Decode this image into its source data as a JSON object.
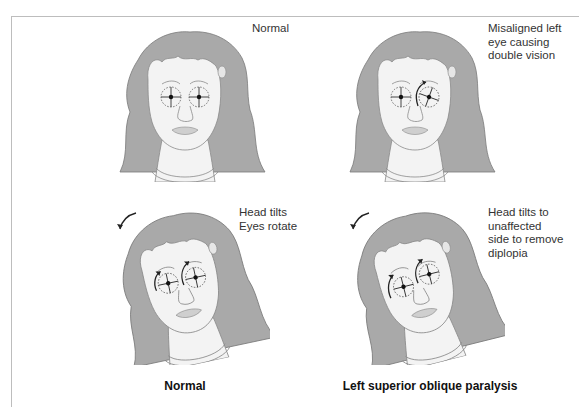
{
  "figure": {
    "panels": [
      {
        "id": "normal-upright",
        "note": "Normal",
        "head_tilted": false,
        "eye_arrows": []
      },
      {
        "id": "palsy-upright",
        "note": "Misaligned left\neye causing\ndouble vision",
        "head_tilted": false,
        "eye_arrows": [
          "left-eye-extorsion"
        ]
      },
      {
        "id": "normal-tilted",
        "note": "Head tilts\nEyes rotate",
        "head_tilted": true,
        "eye_arrows": [
          "right-eye",
          "left-eye"
        ]
      },
      {
        "id": "palsy-tilted",
        "note": "Head tilts to\nunaffected\nside to remove\ndiplopia",
        "head_tilted": true,
        "eye_arrows": [
          "right-eye",
          "left-eye"
        ]
      }
    ],
    "captions": {
      "left": "Normal",
      "right": "Left superior oblique paralysis"
    },
    "colors": {
      "hair": "#a9a9a9",
      "hair_outline": "#7a7a7a",
      "skin": "#f3f3f3",
      "line": "#8a8a8a",
      "arrow": "#222222",
      "frame": "#bdbdbd"
    }
  }
}
